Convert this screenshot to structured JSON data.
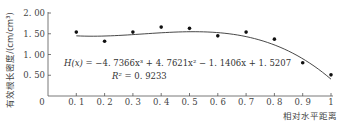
{
  "chart_data": {
    "type": "scatter",
    "title": "",
    "xlabel": "相对水平距离",
    "ylabel": "有效根长密度/(cm/cm³)",
    "xlim": [
      0,
      1
    ],
    "ylim": [
      0,
      2
    ],
    "x_ticks": [
      "0",
      "0.1",
      "0.2",
      "0.3",
      "0.4",
      "0.5",
      "0.6",
      "0.7",
      "0.8",
      "0.9",
      "1"
    ],
    "y_ticks": [
      "0.50",
      "1.00",
      "1.50",
      "2.00"
    ],
    "grid": false,
    "series": [
      {
        "name": "observed",
        "type": "scatter",
        "x": [
          0.1,
          0.2,
          0.3,
          0.4,
          0.5,
          0.6,
          0.7,
          0.8,
          0.9,
          1.0
        ],
        "y": [
          1.54,
          1.32,
          1.54,
          1.66,
          1.63,
          1.45,
          1.54,
          1.37,
          0.8,
          0.51
        ]
      },
      {
        "name": "fit",
        "type": "line",
        "equation": "H(x) = -4.7366x^3 + 4.7621x^2 - 1.1406x + 1.5207",
        "coefficients": [
          -4.7366,
          4.7621,
          -1.1406,
          1.5207
        ],
        "x_range": [
          0.1,
          1.0
        ]
      }
    ],
    "annotations": {
      "equation_prefix": "H(x)",
      "equation_body": " = −4. 7366x³ + 4. 7621x² − 1. 1406x + 1. 5207",
      "r2_label": "R²",
      "r2_value": " = 0. 9233"
    }
  },
  "axes": {
    "y_tick_labels": [
      "2. 00",
      "1. 50",
      "1. 00",
      "0. 50"
    ],
    "x_tick_labels": [
      "0",
      "0. 1",
      "0. 2",
      "0. 3",
      "0. 4",
      "0. 5",
      "0. 6",
      "0. 7",
      "0. 8",
      "0. 9",
      "1"
    ],
    "x_title": "相对水平距离",
    "y_title": "有效根长密度/(cm/cm³)"
  }
}
